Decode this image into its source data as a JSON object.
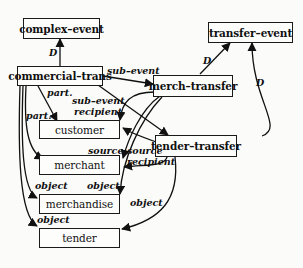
{
  "diagram": {
    "nodes": [
      {
        "id": "complex-event",
        "label": "complex–event"
      },
      {
        "id": "transfer-event",
        "label": "transfer–event"
      },
      {
        "id": "commercial-trans",
        "label": "commercial–trans"
      },
      {
        "id": "merch-transfer",
        "label": "merch–transfer"
      },
      {
        "id": "customer",
        "label": "customer"
      },
      {
        "id": "tender-transfer",
        "label": "tender–transfer"
      },
      {
        "id": "merchant",
        "label": "merchant"
      },
      {
        "id": "merchandise",
        "label": "merchandise"
      },
      {
        "id": "tender",
        "label": "tender"
      }
    ],
    "edge_labels": {
      "d_complex": "D",
      "d_merch_transfer": "D",
      "d_tender_transfer": "D",
      "sub_event_1": "sub–event",
      "sub_event_2": "sub–event",
      "part_1": "part.",
      "part_2": "part.",
      "recipient_1": "recipient",
      "recipient_2": "recipient",
      "source_1": "source",
      "source_2": "source",
      "object_1": "object",
      "object_2": "object",
      "object_3": "object",
      "object_4": "object"
    },
    "edges": [
      {
        "from": "commercial-trans",
        "to": "complex-event",
        "label": "D"
      },
      {
        "from": "merch-transfer",
        "to": "transfer-event",
        "label": "D"
      },
      {
        "from": "tender-transfer",
        "to": "transfer-event",
        "label": "D"
      },
      {
        "from": "commercial-trans",
        "to": "merch-transfer",
        "label": "sub-event"
      },
      {
        "from": "commercial-trans",
        "to": "tender-transfer",
        "label": "sub-event"
      },
      {
        "from": "commercial-trans",
        "to": "customer",
        "label": "part."
      },
      {
        "from": "commercial-trans",
        "to": "merchant",
        "label": "part."
      },
      {
        "from": "commercial-trans",
        "to": "merchandise",
        "label": "object"
      },
      {
        "from": "commercial-trans",
        "to": "tender",
        "label": "object"
      },
      {
        "from": "merch-transfer",
        "to": "customer",
        "label": "recipient"
      },
      {
        "from": "merch-transfer",
        "to": "merchant",
        "label": "source"
      },
      {
        "from": "merch-transfer",
        "to": "merchandise",
        "label": "object"
      },
      {
        "from": "tender-transfer",
        "to": "customer",
        "label": "source"
      },
      {
        "from": "tender-transfer",
        "to": "merchant",
        "label": "recipient"
      },
      {
        "from": "tender-transfer",
        "to": "tender",
        "label": "object"
      }
    ]
  }
}
